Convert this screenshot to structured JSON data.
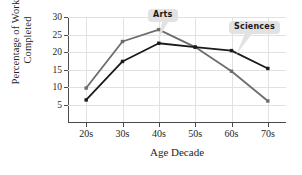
{
  "chart_data": {
    "type": "line",
    "title": "",
    "xlabel": "Age Decade",
    "ylabel_line1": "Percentage of Works",
    "ylabel_line2": "Completed",
    "categories": [
      "20s",
      "30s",
      "40s",
      "50s",
      "60s",
      "70s"
    ],
    "ytick_labels": [
      "5",
      "10",
      "15",
      "20",
      "25",
      "30"
    ],
    "ytick_values": [
      5,
      10,
      15,
      20,
      25,
      30
    ],
    "ylim": [
      0,
      30
    ],
    "grid": true,
    "legend_position": "inline-callouts",
    "series": [
      {
        "name": "Arts",
        "color": "#6e6c6d",
        "values": [
          9.7,
          23.0,
          26.4,
          21.4,
          14.5,
          6.0
        ]
      },
      {
        "name": "Sciences",
        "color": "#1c1a1a",
        "values": [
          6.3,
          17.3,
          22.5,
          21.4,
          20.4,
          15.3
        ]
      }
    ],
    "annotations": [
      {
        "label": "Arts",
        "anchor_category": "40s",
        "anchor_value": 26.4
      },
      {
        "label": "Sciences",
        "anchor_category": "60s",
        "anchor_value": 20.4
      }
    ]
  },
  "colors": {
    "arts": "#6e6c6d",
    "sciences": "#1c1a1a",
    "axis": "#4c4a4a",
    "grid": "#e2e0e1",
    "callout_bg": "#e3e1e2",
    "text": "#221f1f"
  }
}
